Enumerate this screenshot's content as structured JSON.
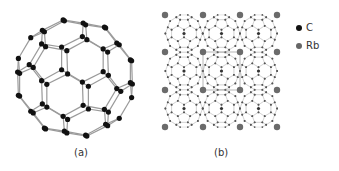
{
  "figure": {
    "panels": [
      {
        "id": "a",
        "label": "(a)",
        "description": "C60 fullerene molecule (buckminsterfullerene) ball-and-stick model"
      },
      {
        "id": "b",
        "label": "(b)",
        "description": "Rb3C60 crystal lattice: 3x3 array of C60 molecules with Rb atoms at grid vertices"
      }
    ],
    "legend": [
      {
        "symbol": "●",
        "label": "C",
        "color": "#111111"
      },
      {
        "symbol": "●",
        "label": "Rb",
        "color": "#666666"
      }
    ],
    "colors": {
      "carbon": "#111111",
      "bond": "#9a9a9a",
      "rubidium": "#6b6b6b",
      "lattice_atom": "#555555",
      "background": "#ffffff"
    },
    "lattice": {
      "rows": 3,
      "cols": 3,
      "rb_grid_x": [
        165,
        203,
        240,
        277
      ],
      "rb_grid_y": [
        15,
        52,
        90,
        127
      ],
      "cell_size": 37.5
    }
  }
}
